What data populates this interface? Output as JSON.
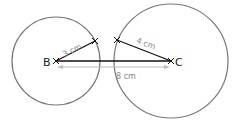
{
  "diagram": {
    "points": [
      {
        "name": "B",
        "x": 56,
        "y": 61
      },
      {
        "name": "C",
        "x": 171,
        "y": 61
      }
    ],
    "circles": [
      {
        "center": "B",
        "radius_px": 44
      },
      {
        "center": "C",
        "radius_px": 57
      }
    ],
    "segments": [
      {
        "from": "B",
        "to": "C",
        "label": ""
      },
      {
        "from": "B",
        "to": "intersection-B",
        "label": "3 cm"
      },
      {
        "from": "intersection-C",
        "to": "C",
        "label": "4 cm"
      }
    ],
    "measurements": {
      "bc_label": "8 cm",
      "b_radius_label": "3 cm",
      "c_radius_label": "4 cm"
    },
    "labels": {
      "point_b": "B",
      "point_c": "C"
    },
    "colors": {
      "circle": "#777777",
      "segment": "#111111",
      "measure": "#aaaaaa",
      "label_gray": "#888888"
    }
  }
}
